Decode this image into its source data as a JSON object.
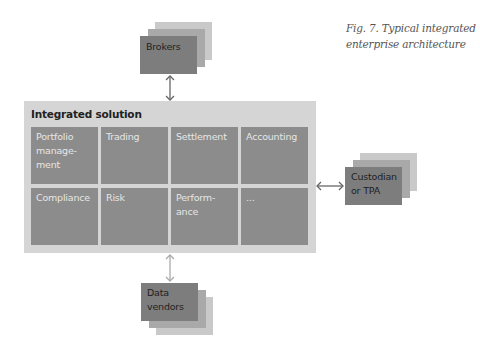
{
  "caption": {
    "line1": "Fig. 7. Typical integrated",
    "line2": "enterprise architecture"
  },
  "integrated_solution": {
    "title": "Integrated solution",
    "modules": [
      {
        "label": "Portfolio\nmanage-\nment"
      },
      {
        "label": "Trading"
      },
      {
        "label": "Settlement"
      },
      {
        "label": "Accounting"
      },
      {
        "label": "Compliance"
      },
      {
        "label": "Risk"
      },
      {
        "label": "Perform-\nance"
      },
      {
        "label": "..."
      }
    ]
  },
  "external_systems": {
    "brokers": {
      "label": "Brokers"
    },
    "custodian": {
      "label": "Custodian\nor TPA"
    },
    "data_vendors": {
      "label": "Data\nvendors"
    }
  },
  "colors": {
    "outer_box": "#d5d5d5",
    "module_cell": "#8c8c8c",
    "stack_front": "#7d7d7d",
    "stack_middle": "#a9a9a9",
    "stack_back": "#c9c9c9",
    "arrow_dark": "#666666",
    "arrow_light": "#aaaaaa"
  }
}
